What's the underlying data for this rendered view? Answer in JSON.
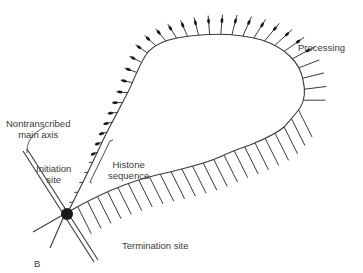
{
  "diagram": {
    "labels": {
      "processing": "Processing",
      "nontranscribed_line1": "Nontranscribed",
      "nontranscribed_line2": "main axis",
      "initiation_line1": "Initiation",
      "initiation_line2": "site",
      "histone_line1": "Histone",
      "histone_line2": "sequence",
      "termination": "Termination site",
      "panel": "B"
    },
    "colors": {
      "stroke": "#3a3a3a",
      "background": "#ffffff"
    }
  }
}
